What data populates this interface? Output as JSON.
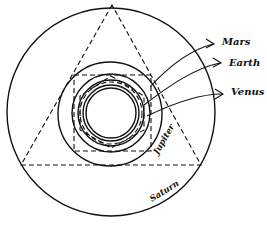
{
  "diagram": {
    "type": "nested orbits with inscribed/circumscribed polyhedra",
    "labels": {
      "mars": "Mars",
      "earth": "Earth",
      "venus": "Venus",
      "jupiter": "Jupiter",
      "saturn": "Saturn"
    },
    "orbits": [
      {
        "name": "Saturn",
        "cx": 111,
        "cy": 111,
        "r": 103
      },
      {
        "name": "Jupiter",
        "cx": 111,
        "cy": 111,
        "r": 52
      },
      {
        "name": "Mars",
        "cx": 111,
        "cy": 111,
        "r": 39
      },
      {
        "name": "Earth",
        "cx": 111,
        "cy": 111,
        "r": 33
      },
      {
        "name": "Venus",
        "cx": 111,
        "cy": 111,
        "r": 29
      }
    ],
    "solids": [
      {
        "shape": "triangle",
        "between": [
          "Saturn",
          "Jupiter"
        ]
      },
      {
        "shape": "square",
        "between": [
          "Jupiter",
          "Mars"
        ]
      }
    ],
    "colors": {
      "ink": "#111111",
      "background": "#ffffff"
    }
  }
}
